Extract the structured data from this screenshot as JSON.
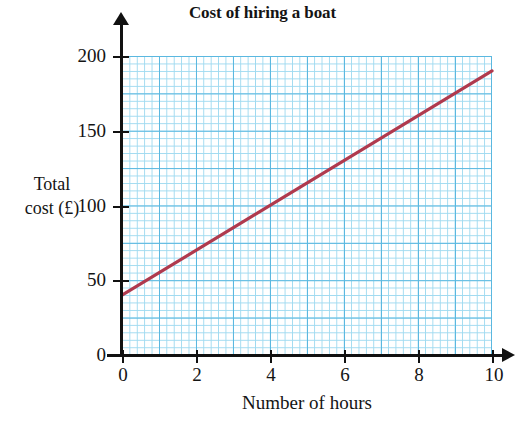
{
  "chart_data": {
    "type": "line",
    "title": "Cost of hiring a boat",
    "xlabel": "Number of hours",
    "ylabel_line1": "Total",
    "ylabel_line2": "cost (£)",
    "xlim": [
      0,
      10
    ],
    "ylim": [
      0,
      200
    ],
    "grid": true,
    "legend": null,
    "x_ticks": [
      "0",
      "2",
      "4",
      "6",
      "8",
      "10"
    ],
    "x_tick_values": [
      0,
      2,
      4,
      6,
      8,
      10
    ],
    "y_ticks": [
      "0",
      "50",
      "100",
      "150",
      "200"
    ],
    "y_tick_values": [
      0,
      50,
      100,
      150,
      200
    ],
    "minor_grid_x_step": 0.2,
    "minor_grid_y_step": 5,
    "major_grid_x_step": 1,
    "major_grid_y_step": 25,
    "series": [
      {
        "name": "Cost of hiring a boat",
        "color": "#b03a4e",
        "equation": "y = 40 + 15x",
        "intercept": 40,
        "slope": 15,
        "x": [
          0,
          1,
          2,
          3,
          4,
          5,
          6,
          7,
          8,
          9,
          10
        ],
        "values": [
          40,
          55,
          70,
          85,
          100,
          115,
          130,
          145,
          160,
          175,
          190
        ]
      }
    ]
  },
  "colors": {
    "line": "#b03a4e",
    "grid_major": "#5bb8e0",
    "grid_minor": "#9fdaf0",
    "axis": "#111111",
    "text": "#141414",
    "background": "#ffffff"
  }
}
